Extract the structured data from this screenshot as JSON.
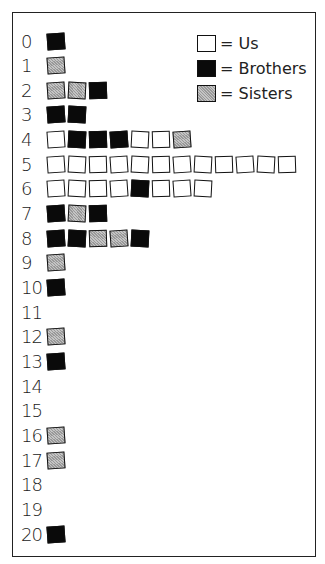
{
  "legend": [
    {
      "key": "us",
      "label": "= Us"
    },
    {
      "key": "brothers",
      "label": "= Brothers"
    },
    {
      "key": "sisters",
      "label": "= Sisters"
    }
  ],
  "colors": {
    "us": "#ffffff",
    "brothers": "#0a0a0a",
    "sisters": "#b0b0b0"
  },
  "rows": [
    {
      "label": "0",
      "cells": [
        "brothers"
      ]
    },
    {
      "label": "1",
      "cells": [
        "sisters"
      ]
    },
    {
      "label": "2",
      "cells": [
        "sisters",
        "sisters",
        "brothers"
      ]
    },
    {
      "label": "3",
      "cells": [
        "brothers",
        "brothers"
      ]
    },
    {
      "label": "4",
      "cells": [
        "us",
        "brothers",
        "brothers",
        "brothers",
        "us",
        "us",
        "sisters"
      ]
    },
    {
      "label": "5",
      "cells": [
        "us",
        "us",
        "us",
        "us",
        "us",
        "us",
        "us",
        "us",
        "us",
        "us",
        "us",
        "us"
      ]
    },
    {
      "label": "6",
      "cells": [
        "us",
        "us",
        "us",
        "us",
        "brothers",
        "us",
        "us",
        "us"
      ]
    },
    {
      "label": "7",
      "cells": [
        "brothers",
        "sisters",
        "brothers"
      ]
    },
    {
      "label": "8",
      "cells": [
        "brothers",
        "brothers",
        "sisters",
        "sisters",
        "brothers"
      ]
    },
    {
      "label": "9",
      "cells": [
        "sisters"
      ]
    },
    {
      "label": "10",
      "cells": [
        "brothers"
      ]
    },
    {
      "label": "11",
      "cells": []
    },
    {
      "label": "12",
      "cells": [
        "sisters"
      ]
    },
    {
      "label": "13",
      "cells": [
        "brothers"
      ]
    },
    {
      "label": "14",
      "cells": []
    },
    {
      "label": "15",
      "cells": []
    },
    {
      "label": "16",
      "cells": [
        "sisters"
      ]
    },
    {
      "label": "17",
      "cells": [
        "sisters"
      ]
    },
    {
      "label": "18",
      "cells": []
    },
    {
      "label": "19",
      "cells": []
    },
    {
      "label": "20",
      "cells": [
        "brothers"
      ]
    }
  ],
  "chart_data": {
    "type": "bar",
    "title": "",
    "xlabel": "",
    "ylabel": "",
    "orientation": "horizontal-stacked-pictogram",
    "categories": [
      "0",
      "1",
      "2",
      "3",
      "4",
      "5",
      "6",
      "7",
      "8",
      "9",
      "10",
      "11",
      "12",
      "13",
      "14",
      "15",
      "16",
      "17",
      "18",
      "19",
      "20"
    ],
    "series": [
      {
        "name": "Us",
        "values": [
          0,
          0,
          0,
          0,
          3,
          12,
          7,
          0,
          0,
          0,
          0,
          0,
          0,
          0,
          0,
          0,
          0,
          0,
          0,
          0,
          0
        ]
      },
      {
        "name": "Brothers",
        "values": [
          1,
          0,
          1,
          2,
          3,
          0,
          1,
          2,
          3,
          0,
          1,
          0,
          0,
          1,
          0,
          0,
          0,
          0,
          0,
          0,
          1
        ]
      },
      {
        "name": "Sisters",
        "values": [
          0,
          1,
          2,
          0,
          1,
          0,
          0,
          1,
          2,
          1,
          0,
          0,
          1,
          0,
          0,
          0,
          1,
          1,
          0,
          0,
          0
        ]
      }
    ],
    "legend": [
      "Us",
      "Brothers",
      "Sisters"
    ],
    "legend_position": "top-right",
    "grid": false
  }
}
